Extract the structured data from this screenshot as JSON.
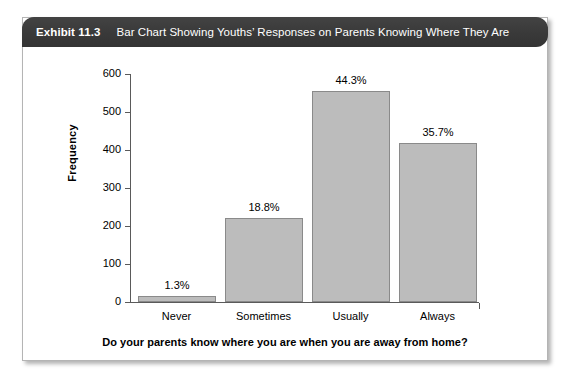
{
  "exhibit": {
    "number": "Exhibit 11.3",
    "caption": "Bar Chart Showing Youths’ Responses on Parents Knowing Where They Are"
  },
  "colors": {
    "header_background": "#3b3b3b",
    "header_text": "#ffffff",
    "bar_fill": "#bcbcbc",
    "bar_stroke": "#8a8a8a",
    "axis": "#5a5a5a",
    "card_background": "#ffffff",
    "card_border": "#b4b4b4",
    "text": "#000000"
  },
  "chart_data": {
    "type": "bar",
    "title": "Bar Chart Showing Youths’ Responses on Parents Knowing Where They Are",
    "xlabel": "Do your parents know where you are when you are away from home?",
    "ylabel": "Frequency",
    "categories": [
      "Never",
      "Sometimes",
      "Usually",
      "Always"
    ],
    "values": [
      17,
      221,
      555,
      418
    ],
    "data_labels": [
      "1.3%",
      "18.8%",
      "44.3%",
      "35.7%"
    ],
    "ylim": [
      0,
      600
    ],
    "ytick_labels": [
      "0",
      "100",
      "200",
      "300",
      "400",
      "500",
      "600"
    ],
    "ytick_values": [
      0,
      100,
      200,
      300,
      400,
      500,
      600
    ],
    "grid": false,
    "legend": false,
    "legend_position": "none"
  }
}
